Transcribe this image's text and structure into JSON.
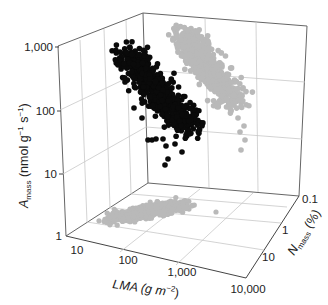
{
  "chart_data": {
    "type": "scatter",
    "subtype": "3d-scatter-with-projections",
    "title": "",
    "axes": {
      "z": {
        "label": "A_mass (nmol g^-1 s^-1)",
        "label_main": "A",
        "label_sub": "mass",
        "label_unit": " (nmol g",
        "scale": "log",
        "range": [
          1,
          1000
        ],
        "ticks": [
          "1",
          "10",
          "100",
          "1,000"
        ]
      },
      "x": {
        "label": "LMA (g m^-2)",
        "label_main": "LMA (g m",
        "scale": "log",
        "range": [
          10,
          10000
        ],
        "ticks": [
          "10",
          "100",
          "1,000",
          "10,000"
        ]
      },
      "y": {
        "label": "N_mass (%)",
        "label_main": "N",
        "label_sub": "mass",
        "label_unit": " (%)",
        "scale": "log",
        "range": [
          0.1,
          10
        ],
        "ticks": [
          "0.1",
          "1",
          "10"
        ]
      }
    },
    "series": [
      {
        "name": "3D leaf economics data",
        "color": "#000000",
        "description": "Black points: main cloud, A_mass decreases as LMA increases, roughly 10-700 nmol g-1 s-1"
      },
      {
        "name": "Projection A_mass vs N_mass (back wall)",
        "color": "#b9b9b9",
        "description": "Grey points projected on back wall"
      },
      {
        "name": "Projection LMA vs N_mass (floor)",
        "color": "#b9b9b9",
        "description": "Grey points projected on floor, LMA ~ 30-2000 g m-2"
      }
    ],
    "grid": true,
    "legend": "none"
  },
  "labels": {
    "z_ticks": [
      "1,000",
      "100",
      "10",
      "1"
    ],
    "x_ticks": [
      "10",
      "100",
      "1,000",
      "10,000"
    ],
    "y_ticks": [
      "0.1",
      "1",
      "10"
    ],
    "z_axis_main": "A",
    "z_axis_sub": "mass",
    "z_axis_unit": " (nmol g",
    "z_axis_exp1": "−1",
    "z_axis_s": " s",
    "z_axis_exp2": "−1",
    "z_axis_close": ")",
    "x_axis_main": "LMA (g m",
    "x_axis_exp": "−2",
    "x_axis_close": ")",
    "y_axis_main": "N",
    "y_axis_sub": "mass",
    "y_axis_unit": " (%)"
  },
  "colors": {
    "black_points": "#0a0a0a",
    "grey_points": "#b9b9b9",
    "grid": "#c8c8c8",
    "axis": "#555555"
  }
}
